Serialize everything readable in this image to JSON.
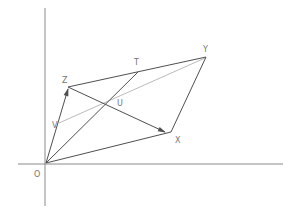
{
  "figure": {
    "canvas": {
      "width": 299,
      "height": 213
    },
    "colors": {
      "background": "#ffffff",
      "axis": "#8a8a8a",
      "dark_line": "#4f4f4f",
      "grey_line": "#bbbbbb",
      "label_text": "#757575"
    },
    "points": {
      "O": [
        46,
        163
      ],
      "Z": [
        68,
        88
      ],
      "V": [
        59,
        123
      ],
      "T": [
        138,
        72
      ],
      "U": [
        110,
        102
      ],
      "X": [
        169,
        133
      ],
      "Y": [
        206,
        57
      ]
    },
    "axes": {
      "y_axis": {
        "from": [
          45,
          8
        ],
        "to": [
          45,
          206
        ]
      },
      "x_axis": {
        "from": [
          18,
          164
        ],
        "to": [
          283,
          164
        ]
      }
    },
    "segments": [
      {
        "name": "segment-y-axis",
        "from": [
          45,
          8
        ],
        "to": [
          45,
          206
        ],
        "stroke": "axis",
        "arrow": false
      },
      {
        "name": "segment-x-axis",
        "from": [
          18,
          164
        ],
        "to": [
          283,
          164
        ],
        "stroke": "axis",
        "arrow": false
      },
      {
        "name": "segment-V-Y",
        "from": [
          59,
          123
        ],
        "to": [
          205,
          58
        ],
        "stroke": "grey_line",
        "arrow": false
      },
      {
        "name": "segment-O-Z",
        "from": [
          46,
          163
        ],
        "to": [
          68,
          89
        ],
        "stroke": "dark_line",
        "arrow": true
      },
      {
        "name": "segment-Z-Y",
        "from": [
          68,
          87
        ],
        "to": [
          206,
          57
        ],
        "stroke": "dark_line",
        "arrow": false
      },
      {
        "name": "segment-O-T",
        "from": [
          46,
          163
        ],
        "to": [
          138,
          72
        ],
        "stroke": "dark_line",
        "arrow": false
      },
      {
        "name": "segment-Z-X",
        "from": [
          68,
          87
        ],
        "to": [
          165,
          132
        ],
        "stroke": "dark_line",
        "arrow": true
      },
      {
        "name": "segment-O-X",
        "from": [
          46,
          163
        ],
        "to": [
          171,
          132
        ],
        "stroke": "dark_line",
        "arrow": false
      },
      {
        "name": "segment-Y-X",
        "from": [
          206,
          57
        ],
        "to": [
          171,
          132
        ],
        "stroke": "dark_line",
        "arrow": false
      }
    ],
    "labels": [
      {
        "name": "label-O",
        "text": "O",
        "x": 34,
        "y": 177
      },
      {
        "name": "label-Z",
        "text": "Z",
        "x": 62,
        "y": 83
      },
      {
        "name": "label-V",
        "text": "V",
        "x": 52,
        "y": 128
      },
      {
        "name": "label-T",
        "text": "T",
        "x": 134,
        "y": 65
      },
      {
        "name": "label-U",
        "text": "U",
        "x": 117,
        "y": 106
      },
      {
        "name": "label-Y",
        "text": "Y",
        "x": 203,
        "y": 52
      },
      {
        "name": "label-X",
        "text": "X",
        "x": 175,
        "y": 143
      }
    ]
  }
}
